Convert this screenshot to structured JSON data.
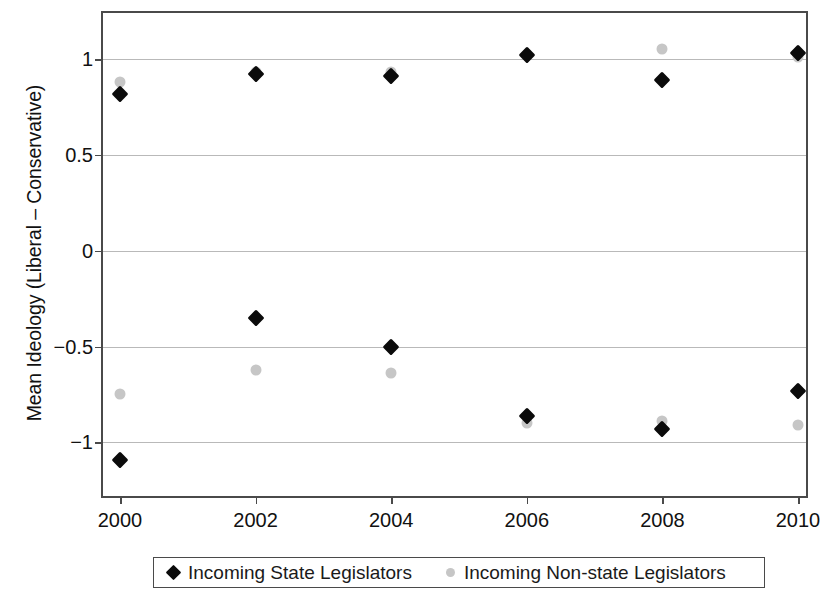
{
  "chart_data": {
    "type": "scatter",
    "title": "",
    "xlabel": "",
    "ylabel": "Mean Ideology (Liberal – Conservative)",
    "categories": [
      "2000",
      "2002",
      "2004",
      "2006",
      "2008",
      "2010"
    ],
    "x": [
      2000,
      2002,
      2004,
      2006,
      2008,
      2010
    ],
    "xlim": [
      2000,
      2010
    ],
    "ylim": [
      -1.28,
      1.24
    ],
    "yticks": [
      1,
      0.5,
      0,
      -0.5,
      -1
    ],
    "ytick_labels": [
      "1",
      "0.5",
      "0",
      "−0.5",
      "−1"
    ],
    "grid": true,
    "legend_position": "bottom",
    "series": [
      {
        "name": "Incoming State Legislators",
        "marker": "diamond",
        "color": "#0b0b0b",
        "values_upper": [
          0.82,
          0.92,
          0.91,
          1.02,
          0.89,
          1.03
        ],
        "values_lower": [
          -1.09,
          -0.35,
          -0.5,
          -0.86,
          -0.93,
          -0.73
        ]
      },
      {
        "name": "Incoming Non-state Legislators",
        "marker": "circle",
        "color": "#c6c6c6",
        "values_upper": [
          0.88,
          0.93,
          0.93,
          1.02,
          1.05,
          1.01
        ],
        "values_lower": [
          -0.75,
          -0.62,
          -0.64,
          -0.9,
          -0.89,
          -0.91
        ]
      }
    ],
    "points": [
      {
        "series": "Incoming State Legislators",
        "x": 2000,
        "y": 0.82
      },
      {
        "series": "Incoming State Legislators",
        "x": 2002,
        "y": 0.92
      },
      {
        "series": "Incoming State Legislators",
        "x": 2004,
        "y": 0.91
      },
      {
        "series": "Incoming State Legislators",
        "x": 2006,
        "y": 1.02
      },
      {
        "series": "Incoming State Legislators",
        "x": 2008,
        "y": 0.89
      },
      {
        "series": "Incoming State Legislators",
        "x": 2010,
        "y": 1.03
      },
      {
        "series": "Incoming State Legislators",
        "x": 2000,
        "y": -1.09
      },
      {
        "series": "Incoming State Legislators",
        "x": 2002,
        "y": -0.35
      },
      {
        "series": "Incoming State Legislators",
        "x": 2004,
        "y": -0.5
      },
      {
        "series": "Incoming State Legislators",
        "x": 2006,
        "y": -0.86
      },
      {
        "series": "Incoming State Legislators",
        "x": 2008,
        "y": -0.93
      },
      {
        "series": "Incoming State Legislators",
        "x": 2010,
        "y": -0.73
      },
      {
        "series": "Incoming Non-state Legislators",
        "x": 2000,
        "y": 0.88
      },
      {
        "series": "Incoming Non-state Legislators",
        "x": 2002,
        "y": 0.93
      },
      {
        "series": "Incoming Non-state Legislators",
        "x": 2004,
        "y": 0.93
      },
      {
        "series": "Incoming Non-state Legislators",
        "x": 2006,
        "y": 1.02
      },
      {
        "series": "Incoming Non-state Legislators",
        "x": 2008,
        "y": 1.05
      },
      {
        "series": "Incoming Non-state Legislators",
        "x": 2010,
        "y": 1.01
      },
      {
        "series": "Incoming Non-state Legislators",
        "x": 2000,
        "y": -0.75
      },
      {
        "series": "Incoming Non-state Legislators",
        "x": 2002,
        "y": -0.62
      },
      {
        "series": "Incoming Non-state Legislators",
        "x": 2004,
        "y": -0.64
      },
      {
        "series": "Incoming Non-state Legislators",
        "x": 2006,
        "y": -0.9
      },
      {
        "series": "Incoming Non-state Legislators",
        "x": 2008,
        "y": -0.89
      },
      {
        "series": "Incoming Non-state Legislators",
        "x": 2010,
        "y": -0.91
      }
    ]
  },
  "axis": {
    "y_title": "Mean Ideology (Liberal – Conservative)",
    "y_tick_labels": [
      "1",
      "0.5",
      "0",
      "−0.5",
      "−1"
    ],
    "x_tick_labels": [
      "2000",
      "2002",
      "2004",
      "2006",
      "2008",
      "2010"
    ]
  },
  "legend": {
    "entries": [
      {
        "label": "Incoming State Legislators",
        "marker": "diamond-icon",
        "color": "#0b0b0b"
      },
      {
        "label": "Incoming Non-state Legislators",
        "marker": "circle-icon",
        "color": "#c6c6c6"
      }
    ]
  },
  "colors": {
    "state_marker": "#0b0b0b",
    "nonstate_marker": "#c6c6c6",
    "gridline": "#b9b9b9",
    "frame": "#4a4a4a",
    "text": "#111111",
    "background": "#ffffff"
  }
}
